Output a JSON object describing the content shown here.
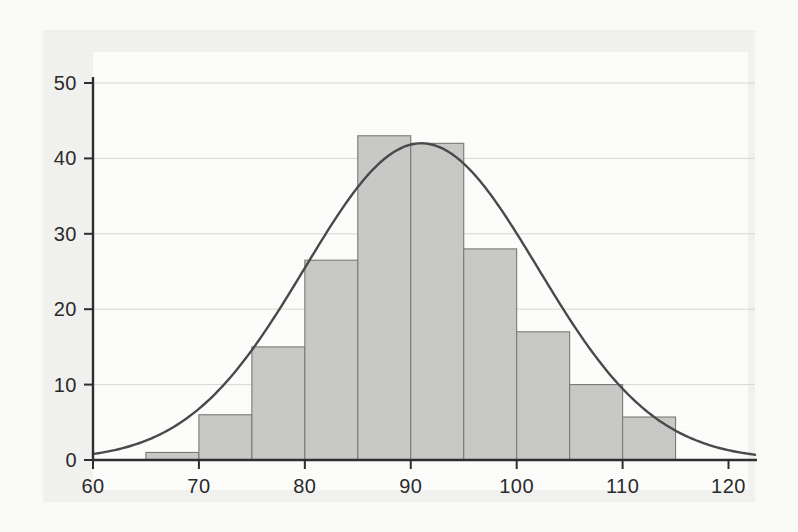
{
  "figure": {
    "title": "",
    "background_color": "#fbfbfa",
    "panel_color": "#f2f2f0",
    "bar_fill_color": "#c9c9c7",
    "bar_edge_color": "#7a7a78",
    "curve_color": "#4a4a4a",
    "grid_color": "#d8d8d6",
    "axis_color": "#2f2f2f"
  },
  "chart_data": {
    "type": "bar",
    "title": "",
    "subtitle": "",
    "xlabel": "",
    "ylabel": "",
    "xlim": [
      60,
      122.5
    ],
    "ylim": [
      0,
      51
    ],
    "grid": true,
    "legend": "none",
    "bin_width": 5,
    "bin_edges": [
      65,
      70,
      75,
      80,
      85,
      90,
      95,
      100,
      105,
      110,
      115
    ],
    "categories": [
      "65-70",
      "70-75",
      "75-80",
      "80-85",
      "85-90",
      "90-95",
      "95-100",
      "100-105",
      "105-110",
      "110-115"
    ],
    "values": [
      1,
      6,
      15,
      26.5,
      43,
      42,
      28,
      17,
      10,
      5.7
    ],
    "xticks": [
      60,
      70,
      80,
      90,
      100,
      110,
      120
    ],
    "xtick_labels": [
      "60",
      "70",
      "80",
      "90",
      "100",
      "110",
      "120"
    ],
    "yticks": [
      0,
      10,
      20,
      30,
      40,
      50
    ],
    "ytick_labels": [
      "0",
      "10",
      "20",
      "30",
      "40",
      "50"
    ],
    "gridlines_y": [
      10,
      20,
      30,
      40,
      50
    ],
    "overlay": {
      "type": "line",
      "name": "normal-density-curve",
      "mean": 91,
      "sigma": 11,
      "peak_value": 42,
      "x_start": 60,
      "x_end": 122.5
    }
  }
}
